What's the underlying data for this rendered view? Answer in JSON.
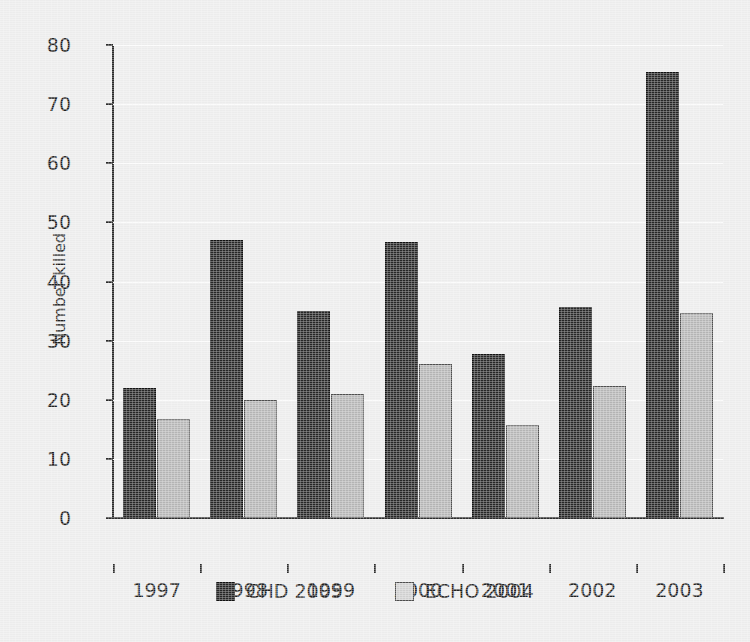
{
  "chart_data": {
    "type": "bar",
    "title": "",
    "subtitle": "",
    "xlabel": "",
    "ylabel": "Number killed",
    "categories": [
      "1997",
      "1998",
      "1999",
      "2000",
      "2001",
      "2002",
      "2003"
    ],
    "series": [
      {
        "name": "CHD 2005",
        "color": "#262626",
        "values": [
          22,
          47,
          35,
          46.7,
          27.8,
          35.7,
          75.5
        ]
      },
      {
        "name": "ECHO 2004",
        "color": "#b4b4b4",
        "values": [
          16.8,
          20,
          21,
          26,
          15.7,
          22.4,
          34.6
        ]
      }
    ],
    "ylim": [
      0,
      80
    ],
    "yticks": [
      0,
      10,
      20,
      30,
      40,
      50,
      60,
      70,
      80
    ],
    "ytick_labels": [
      "0",
      "10",
      "20",
      "30",
      "40",
      "50",
      "60",
      "70",
      "80"
    ],
    "grid": true,
    "grid_axis": "y",
    "legend_position": "bottom",
    "legend_entries": [
      "CHD 2005",
      "ECHO 2004"
    ],
    "background_color": "#ececec",
    "axis_color": "#2b2b2b",
    "text_color": "#202020"
  }
}
